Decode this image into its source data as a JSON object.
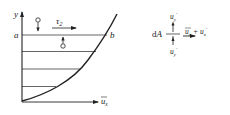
{
  "diagram": {
    "left_figure": {
      "axis_y_label": "y",
      "axis_x_label": "u",
      "axis_x_subscript": "x",
      "point_a_label": "a",
      "point_b_label": "b",
      "shear_label": "τ",
      "shear_subscript": "2",
      "horizontal_lines_y": [
        35,
        52,
        69,
        86
      ]
    },
    "right_figure": {
      "area_label": "dA",
      "top_velocity_label": "u",
      "top_velocity_sub": "y",
      "top_velocity_prime": "′",
      "bottom_velocity_label": "u",
      "bottom_velocity_sub": "y",
      "bottom_velocity_prime": "′",
      "right_mean_label": "u",
      "right_mean_sub": "x",
      "plus_sign": "+",
      "right_fluct_label": "u",
      "right_fluct_sub": "x",
      "right_fluct_prime": "′"
    },
    "colors": {
      "stroke": "#222222",
      "background": "#ffffff"
    }
  }
}
